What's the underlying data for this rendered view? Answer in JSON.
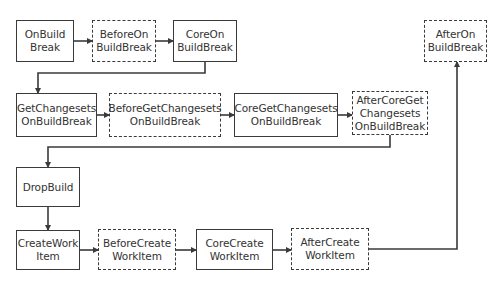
{
  "diagram": {
    "type": "flowchart",
    "colors": {
      "stroke": "#3a3a3a",
      "text": "#333333",
      "background": "#ffffff"
    },
    "nodes": [
      {
        "id": "n1",
        "label": "OnBuild\nBreak",
        "style": "solid",
        "x": 16,
        "y": 20,
        "w": 58,
        "h": 42
      },
      {
        "id": "n2",
        "label": "BeforeOn\nBuildBreak",
        "style": "dashed",
        "x": 92,
        "y": 20,
        "w": 64,
        "h": 42
      },
      {
        "id": "n3",
        "label": "CoreOn\nBuildBreak",
        "style": "solid",
        "x": 173,
        "y": 20,
        "w": 64,
        "h": 42
      },
      {
        "id": "n4",
        "label": "AfterOn\nBuildBreak",
        "style": "dashed",
        "x": 424,
        "y": 20,
        "w": 63,
        "h": 42
      },
      {
        "id": "n5",
        "label": "GetChangesets\nOnBuildBreak",
        "style": "solid",
        "x": 16,
        "y": 93,
        "w": 81,
        "h": 44
      },
      {
        "id": "n6",
        "label": "BeforeGetChangesets\nOnBuildBreak",
        "style": "dashed",
        "x": 109,
        "y": 93,
        "w": 112,
        "h": 44
      },
      {
        "id": "n7",
        "label": "CoreGetChangesets\nOnBuildBreak",
        "style": "solid",
        "x": 234,
        "y": 93,
        "w": 104,
        "h": 44
      },
      {
        "id": "n8",
        "label": "AfterCoreGet\nChangesets\nOnBuildBreak",
        "style": "dashed",
        "x": 352,
        "y": 91,
        "w": 76,
        "h": 44
      },
      {
        "id": "n9",
        "label": "DropBuild",
        "style": "solid",
        "x": 16,
        "y": 167,
        "w": 64,
        "h": 40
      },
      {
        "id": "n10",
        "label": "CreateWork\nItem",
        "style": "solid",
        "x": 16,
        "y": 230,
        "w": 64,
        "h": 40
      },
      {
        "id": "n11",
        "label": "BeforeCreate\nWorkItem",
        "style": "dashed",
        "x": 98,
        "y": 229,
        "w": 78,
        "h": 41
      },
      {
        "id": "n12",
        "label": "CoreCreate\nWorkItem",
        "style": "solid",
        "x": 196,
        "y": 229,
        "w": 77,
        "h": 41
      },
      {
        "id": "n13",
        "label": "AfterCreate\nWorkItem",
        "style": "dashed",
        "x": 291,
        "y": 228,
        "w": 78,
        "h": 42
      }
    ],
    "edges": [
      {
        "from": "n1",
        "to": "n2",
        "points": [
          [
            74,
            41
          ],
          [
            92,
            41
          ]
        ]
      },
      {
        "from": "n2",
        "to": "n3",
        "points": [
          [
            156,
            41
          ],
          [
            173,
            41
          ]
        ]
      },
      {
        "from": "n3",
        "to": "n5",
        "points": [
          [
            205,
            62
          ],
          [
            205,
            73
          ],
          [
            38,
            73
          ],
          [
            38,
            93
          ]
        ]
      },
      {
        "from": "n5",
        "to": "n6",
        "points": [
          [
            97,
            115
          ],
          [
            109,
            115
          ]
        ]
      },
      {
        "from": "n6",
        "to": "n7",
        "points": [
          [
            221,
            115
          ],
          [
            234,
            115
          ]
        ]
      },
      {
        "from": "n7",
        "to": "n8",
        "points": [
          [
            338,
            115
          ],
          [
            352,
            115
          ]
        ]
      },
      {
        "from": "n8",
        "to": "n9",
        "points": [
          [
            390,
            135
          ],
          [
            390,
            147
          ],
          [
            48,
            147
          ],
          [
            48,
            167
          ]
        ]
      },
      {
        "from": "n9",
        "to": "n10",
        "points": [
          [
            48,
            207
          ],
          [
            48,
            230
          ]
        ]
      },
      {
        "from": "n10",
        "to": "n11",
        "points": [
          [
            80,
            250
          ],
          [
            98,
            250
          ]
        ]
      },
      {
        "from": "n11",
        "to": "n12",
        "points": [
          [
            176,
            250
          ],
          [
            196,
            250
          ]
        ]
      },
      {
        "from": "n12",
        "to": "n13",
        "points": [
          [
            273,
            250
          ],
          [
            291,
            250
          ]
        ]
      },
      {
        "from": "n13",
        "to": "n4",
        "points": [
          [
            369,
            249
          ],
          [
            457,
            249
          ],
          [
            457,
            62
          ]
        ]
      }
    ]
  }
}
